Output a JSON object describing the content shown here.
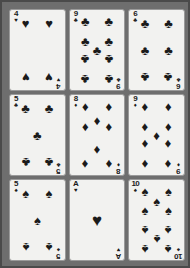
{
  "scene": {
    "title": "Playing cards grid",
    "background_color": "#6e6e6e",
    "border_color": "#4a4a4a",
    "card_face_color": "#f2f2f0",
    "pip_color": "#1b1b1b",
    "rows": 3,
    "columns": 3
  },
  "glyphs": {
    "hearts": "♥",
    "diamonds": "♦",
    "clubs": "♣",
    "spades": "♠"
  },
  "cards": [
    {
      "id": "card-1",
      "rank": "4",
      "suit": "hearts",
      "suit_glyph": "♥",
      "label": "4 of Hearts",
      "pip_count": 4,
      "position": {
        "row": 1,
        "col": 1
      }
    },
    {
      "id": "card-2",
      "rank": "9",
      "suit": "clubs",
      "suit_glyph": "♣",
      "label": "9 of Clubs",
      "pip_count": 9,
      "position": {
        "row": 1,
        "col": 2
      }
    },
    {
      "id": "card-3",
      "rank": "6",
      "suit": "clubs",
      "suit_glyph": "♣",
      "label": "6 of Clubs",
      "pip_count": 6,
      "position": {
        "row": 1,
        "col": 3
      }
    },
    {
      "id": "card-4",
      "rank": "5",
      "suit": "clubs",
      "suit_glyph": "♣",
      "label": "5 of Clubs",
      "pip_count": 5,
      "position": {
        "row": 2,
        "col": 1
      }
    },
    {
      "id": "card-5",
      "rank": "8",
      "suit": "diamonds",
      "suit_glyph": "♦",
      "label": "8 of Diamonds",
      "pip_count": 8,
      "position": {
        "row": 2,
        "col": 2
      }
    },
    {
      "id": "card-6",
      "rank": "9",
      "suit": "diamonds",
      "suit_glyph": "♦",
      "label": "9 of Diamonds",
      "pip_count": 9,
      "position": {
        "row": 2,
        "col": 3
      }
    },
    {
      "id": "card-7",
      "rank": "5",
      "suit": "spades",
      "suit_glyph": "♠",
      "label": "5 of Spades",
      "pip_count": 5,
      "position": {
        "row": 3,
        "col": 1
      }
    },
    {
      "id": "card-8",
      "rank": "A",
      "suit": "hearts",
      "suit_glyph": "♥",
      "label": "Ace of Hearts",
      "pip_count": 1,
      "position": {
        "row": 3,
        "col": 2
      }
    },
    {
      "id": "card-9",
      "rank": "10",
      "suit": "spades",
      "suit_glyph": "♠",
      "label": "10 of Spades",
      "pip_count": 10,
      "position": {
        "row": 3,
        "col": 3
      }
    }
  ]
}
